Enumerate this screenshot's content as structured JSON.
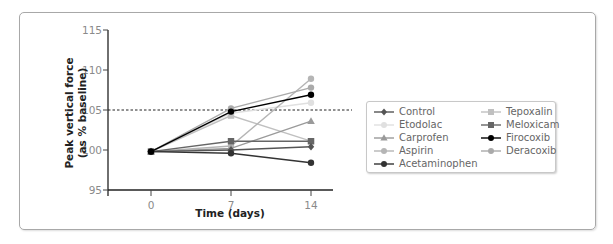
{
  "chart_data": {
    "type": "line",
    "title": "",
    "xlabel": "Time (days)",
    "ylabel": "Peak vertical force (as % baseline)",
    "x": [
      0,
      7,
      14
    ],
    "x_ticks": [
      "0",
      "7",
      "14"
    ],
    "y_ticks": [
      "95",
      "100",
      "105",
      "110",
      "115"
    ],
    "ylim": [
      95,
      115
    ],
    "reference_line": {
      "y": 105,
      "style": "dashed"
    },
    "grid": false,
    "legend_position": "right",
    "series": [
      {
        "name": "Control",
        "values": [
          99.8,
          100.0,
          100.4
        ],
        "color": "#555555",
        "marker": "diamond"
      },
      {
        "name": "Etodolac",
        "values": [
          99.8,
          104.6,
          105.9
        ],
        "color": "#e0e0e0",
        "marker": "circle"
      },
      {
        "name": "Carprofen",
        "values": [
          99.8,
          100.2,
          103.6
        ],
        "color": "#9a9a9a",
        "marker": "triangle"
      },
      {
        "name": "Aspirin",
        "values": [
          99.8,
          100.5,
          108.9
        ],
        "color": "#b5b5b5",
        "marker": "circle"
      },
      {
        "name": "Acetaminophen",
        "values": [
          99.8,
          99.6,
          98.4
        ],
        "color": "#333333",
        "marker": "circle"
      },
      {
        "name": "Tepoxalin",
        "values": [
          99.8,
          104.3,
          101.1
        ],
        "color": "#c0c0c0",
        "marker": "square"
      },
      {
        "name": "Meloxicam",
        "values": [
          99.8,
          101.1,
          101.1
        ],
        "color": "#666666",
        "marker": "square"
      },
      {
        "name": "Firocoxib",
        "values": [
          99.8,
          104.8,
          106.9
        ],
        "color": "#000000",
        "marker": "circle"
      },
      {
        "name": "Deracoxib",
        "values": [
          99.8,
          105.2,
          107.8
        ],
        "color": "#aaaaaa",
        "marker": "circle"
      }
    ]
  },
  "legend": {
    "col1": [
      "Control",
      "Etodolac",
      "Carprofen",
      "Aspirin",
      "Acetaminophen"
    ],
    "col2": [
      "Tepoxalin",
      "Meloxicam",
      "Firocoxib",
      "Deracoxib"
    ]
  }
}
